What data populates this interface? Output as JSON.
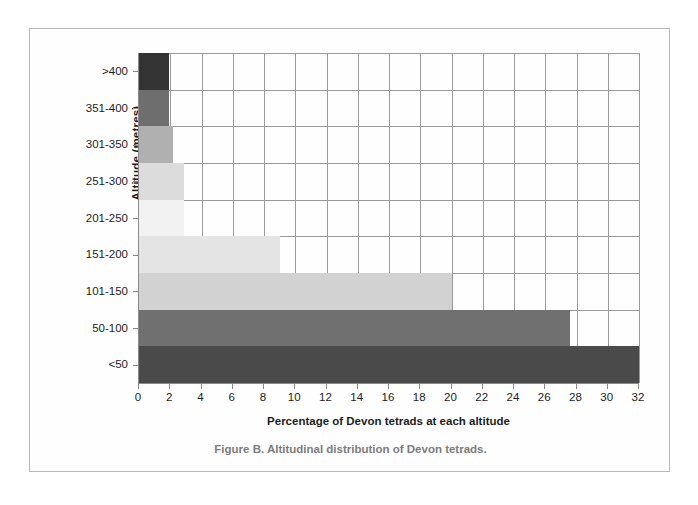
{
  "figure": {
    "caption": "Figure B. Altitudinal distribution of Devon tetrads.",
    "frame_border_color": "#b9b9b9",
    "caption_color": "#7c7c7c"
  },
  "chart_data": {
    "type": "bar",
    "orientation": "horizontal",
    "title": "",
    "xlabel": "Percentage of Devon tetrads at each altitude",
    "ylabel": "Altitude (metres)",
    "categories": [
      ">400",
      "351-400",
      "301-350",
      "251-300",
      "201-250",
      "151-200",
      "101-150",
      "50-100",
      "<50"
    ],
    "values": [
      1.9,
      1.9,
      2.2,
      2.9,
      2.9,
      9.0,
      20.0,
      27.6,
      32.0
    ],
    "bar_colors": [
      "#333333",
      "#6e6e6e",
      "#b0b0b0",
      "#dcdcdc",
      "#f2f2f2",
      "#e4e4e4",
      "#d2d2d2",
      "#707070",
      "#4a4a4a"
    ],
    "xlim": [
      0,
      32
    ],
    "xticks": [
      0,
      2,
      4,
      6,
      8,
      10,
      12,
      14,
      16,
      18,
      20,
      22,
      24,
      26,
      28,
      30,
      32
    ],
    "xtick_labels": [
      "0",
      "2",
      "4",
      "6",
      "8",
      "10",
      "12",
      "14",
      "16",
      "18",
      "20",
      "22",
      "24",
      "26",
      "28",
      "30",
      "32"
    ],
    "grid": true,
    "gridline_color": "#9a9a9a",
    "legend": false,
    "legend_position": "none",
    "axis_color": "#8a8a8a"
  }
}
